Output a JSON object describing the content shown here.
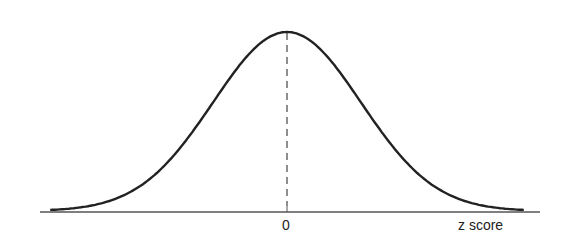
{
  "chart_data": {
    "type": "line",
    "title": "",
    "xlabel": "z score",
    "ylabel": "",
    "x_tick_labels": [
      "0"
    ],
    "x_range": [
      -3.2,
      3.2
    ],
    "mean": 0,
    "std_dev": 1,
    "series": [
      {
        "name": "normal density",
        "x": [
          -3.2,
          -3,
          -2.5,
          -2,
          -1.5,
          -1,
          -0.5,
          0,
          0.5,
          1,
          1.5,
          2,
          2.5,
          3,
          3.2
        ],
        "values": [
          0.0024,
          0.0044,
          0.0175,
          0.054,
          0.1295,
          0.242,
          0.3521,
          0.3989,
          0.3521,
          0.242,
          0.1295,
          0.054,
          0.0175,
          0.0044,
          0.0024
        ]
      }
    ],
    "annotations": [
      {
        "type": "vertical-dashed-line",
        "x": 0
      }
    ],
    "grid": false,
    "legend": "none"
  },
  "labels": {
    "zero": "0",
    "axis_title": "z score"
  },
  "style": {
    "curve_color": "#222222",
    "axis_color": "#555555"
  }
}
